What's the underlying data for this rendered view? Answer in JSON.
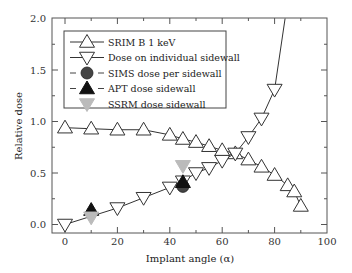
{
  "chart_data": {
    "type": "line",
    "title": "",
    "xlabel": "Implant angle (α)",
    "ylabel": "Relative dose",
    "xlim": [
      -5,
      100
    ],
    "ylim": [
      -0.06,
      2.0
    ],
    "xticks": [
      0,
      20,
      40,
      60,
      80,
      100
    ],
    "xtick_labels": [
      "0",
      "20",
      "40",
      "60",
      "80",
      "100"
    ],
    "yticks": [
      0.0,
      0.5,
      1.0,
      1.5,
      2.0
    ],
    "ytick_labels": [
      "0.0",
      "0.5",
      "1.0",
      "1.5",
      "2.0"
    ],
    "grid": false,
    "legend_position": "top-left",
    "series": [
      {
        "name": "SRIM B 1 keV",
        "marker": "triangle-up-open",
        "line": true,
        "color": "#333333",
        "x": [
          0,
          10,
          20,
          30,
          40,
          45,
          50,
          55,
          60,
          65,
          70,
          75,
          80,
          85,
          87.5,
          90
        ],
        "y": [
          0.94,
          0.93,
          0.92,
          0.92,
          0.87,
          0.83,
          0.8,
          0.76,
          0.72,
          0.69,
          0.63,
          0.56,
          0.48,
          0.38,
          0.32,
          0.18
        ]
      },
      {
        "name": "Dose on individual sidewall",
        "marker": "triangle-down-open",
        "line": true,
        "color": "#333333",
        "x": [
          0,
          20,
          30,
          40,
          45,
          50,
          55,
          60,
          65,
          70,
          75,
          80,
          84
        ],
        "y": [
          0.0,
          0.16,
          0.26,
          0.36,
          0.42,
          0.5,
          0.55,
          0.62,
          0.69,
          0.85,
          1.03,
          1.31,
          2.0
        ],
        "marker_mask": [
          true,
          true,
          true,
          true,
          true,
          true,
          true,
          true,
          true,
          true,
          true,
          true,
          false
        ]
      },
      {
        "name": "SIMS dose per sidewall",
        "marker": "circle-filled",
        "line": false,
        "color": "#444444",
        "x": [
          45
        ],
        "y": [
          0.37
        ]
      },
      {
        "name": "APT dose sidewall",
        "marker": "triangle-up-filled",
        "line": false,
        "color": "#111111",
        "x": [
          10,
          45
        ],
        "y": [
          0.14,
          0.41
        ]
      },
      {
        "name": "SSRM dose sidewall",
        "marker": "triangle-down-filled",
        "line": false,
        "color": "#bbbbbb",
        "x": [
          10,
          45
        ],
        "y": [
          0.07,
          0.57
        ]
      }
    ]
  }
}
